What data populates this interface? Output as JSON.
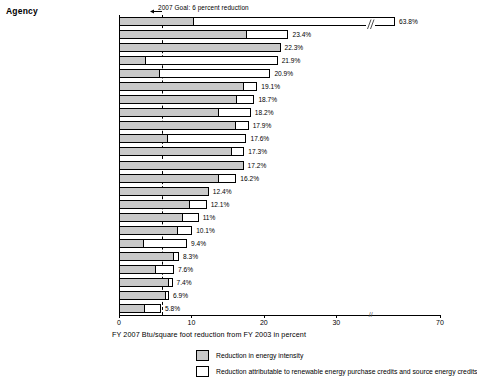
{
  "header": {
    "y_axis_header": "Agency"
  },
  "annotation": {
    "goal_text": "2007 Goal: 6 percent reduction",
    "goal_value": 6
  },
  "axis": {
    "x_title": "FY 2007 Btu/square foot reduction from FY 2003 in percent",
    "ticks": [
      "0",
      "10",
      "20",
      "30",
      "70"
    ],
    "break_marker": "//"
  },
  "legend": {
    "items": [
      {
        "label": "Reduction in energy intensity",
        "swatch": "gray-dotted"
      },
      {
        "label": "Reduction attributable to renewable energy purchase credits and source energy credits",
        "swatch": "white"
      }
    ]
  },
  "chart_data": {
    "type": "bar",
    "orientation": "horizontal",
    "stacked": true,
    "title": "",
    "xlabel": "FY 2007 Btu/square foot reduction from FY 2003 in percent",
    "ylabel": "Agency",
    "xlim": [
      0,
      70
    ],
    "axis_break": {
      "from": 33,
      "to": 62
    },
    "grid": false,
    "legend_position": "bottom",
    "reference_line": {
      "label": "2007 Goal: 6 percent reduction",
      "value": 6,
      "style": "dashed"
    },
    "categories": [
      "EPA",
      "Interior",
      "Commerce",
      "Transportation",
      "Health and Human Services",
      "Homeland Security",
      "National Archives",
      "Agriculture",
      "State",
      "NASA",
      "Housing and Urban Development",
      "Justice",
      "DOE",
      "USPS",
      "Treasury",
      "Total reporting agencies",
      "DOD",
      "GSA",
      "Labor",
      "VA",
      "Tennessee Valley Authority",
      "Social Security Administration",
      "Railroad Retirement Board"
    ],
    "totals": [
      63.8,
      23.4,
      22.3,
      21.9,
      20.9,
      19.1,
      18.7,
      18.2,
      17.9,
      17.6,
      17.3,
      17.2,
      16.2,
      12.4,
      12.1,
      11.0,
      10.1,
      9.4,
      8.3,
      7.6,
      7.4,
      6.9,
      5.8
    ],
    "value_labels": [
      "63.8%",
      "23.4%",
      "22.3%",
      "21.9%",
      "20.9%",
      "19.1%",
      "18.7%",
      "18.2%",
      "17.9%",
      "17.6%",
      "17.3%",
      "17.2%",
      "16.2%",
      "12.4%",
      "12.1%",
      "11%",
      "10.1%",
      "9.4%",
      "8.3%",
      "7.6%",
      "7.4%",
      "6.9%",
      "5.8%"
    ],
    "series": [
      {
        "name": "Reduction in energy intensity",
        "values": [
          10.2,
          17.6,
          22.3,
          3.6,
          5.5,
          17.1,
          16.2,
          13.6,
          16.0,
          6.6,
          15.5,
          17.2,
          13.6,
          12.4,
          9.6,
          8.7,
          8.0,
          3.3,
          7.5,
          5.0,
          6.7,
          6.4,
          3.5
        ]
      },
      {
        "name": "Reduction attributable to renewable energy purchase credits and source energy credits",
        "values": [
          53.6,
          5.8,
          0.0,
          18.3,
          15.4,
          2.0,
          2.5,
          4.6,
          1.9,
          11.0,
          1.8,
          0.0,
          2.6,
          0.0,
          2.5,
          2.3,
          2.1,
          6.1,
          0.8,
          2.6,
          0.7,
          0.5,
          2.3
        ]
      }
    ]
  }
}
